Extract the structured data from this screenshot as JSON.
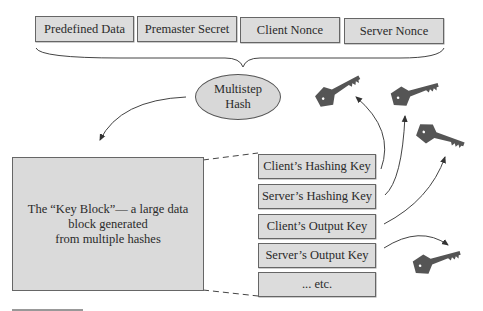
{
  "inputs": [
    {
      "label": "Predefined Data"
    },
    {
      "label": "Premaster Secret"
    },
    {
      "label": "Client Nonce"
    },
    {
      "label": "Server Nonce"
    }
  ],
  "hash": {
    "line1": "Multistep",
    "line2": "Hash"
  },
  "key_block": {
    "line1": "The “Key Block”— a large data",
    "line2": "block generated",
    "line3": "from multiple hashes"
  },
  "keys": [
    {
      "label": "Client’s Hashing Key"
    },
    {
      "label": "Server’s Hashing Key"
    },
    {
      "label": "Client’s Output Key"
    },
    {
      "label": "Server’s Output Key"
    },
    {
      "label": "... etc."
    }
  ],
  "icons": {
    "key": "key-icon"
  },
  "colors": {
    "box_fill": "#dcdcdc",
    "key_fill": "#555555",
    "stroke": "#444444"
  }
}
